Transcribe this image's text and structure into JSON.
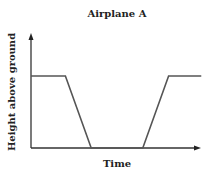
{
  "chart_data": {
    "type": "line",
    "title": "Airplane A",
    "xlabel": "Time",
    "ylabel": "Height above ground",
    "grid": false,
    "legend": "none",
    "xlim": [
      0,
      10
    ],
    "ylim": [
      0,
      10
    ],
    "series": [
      {
        "name": "Airplane A",
        "x": [
          0,
          2,
          3.5,
          6.5,
          8,
          9.9
        ],
        "y": [
          6,
          6,
          0,
          0,
          6,
          6
        ]
      }
    ]
  }
}
